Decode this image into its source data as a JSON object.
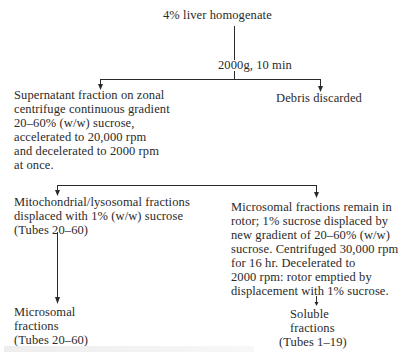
{
  "diagram": {
    "type": "flowchart",
    "root": "4% liver homogenate",
    "step1_condition": "2000g, 10 min",
    "branch1": {
      "left": {
        "lines": [
          "Supernatant fraction on zonal",
          "centrifuge continuous gradient",
          "20–60% (w/w) sucrose,",
          "accelerated to 20,000 rpm",
          "and decelerated to 2000 rpm",
          "at once."
        ]
      },
      "right": {
        "lines": [
          "Debris discarded"
        ]
      }
    },
    "branch2": {
      "left": {
        "lines": [
          "Mitochondrial/lysosomal fractions",
          "displaced with 1% (w/w) sucrose",
          "(Tubes 20–60)"
        ],
        "result": [
          "Microsomal",
          "fractions",
          "(Tubes 20–60)"
        ]
      },
      "right": {
        "lines": [
          "Microsomal fractions remain in",
          "rotor; 1% sucrose displaced by",
          "new gradient of 20–60% (w/w)",
          "sucrose. Centrifuged 30,000 rpm",
          "for 16 hr. Decelerated to",
          "2000 rpm: rotor emptied by",
          "displacement with 1% sucrose."
        ],
        "result": [
          "Soluble",
          "fractions",
          "(Tubes 1–19)"
        ]
      }
    }
  },
  "colors": {
    "ink": "#2a2a2a",
    "background": "#ffffff"
  }
}
